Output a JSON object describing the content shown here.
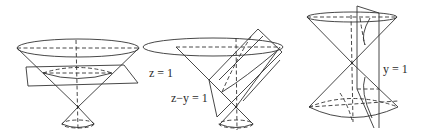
{
  "figures": [
    {
      "id": "cone-horizontal-section",
      "surface": "double cone",
      "plane_label": "z = 1",
      "section_type": "circle"
    },
    {
      "id": "cone-oblique-section",
      "surface": "double cone",
      "plane_label": "z−y = 1",
      "section_type": "parabola"
    },
    {
      "id": "cone-vertical-section",
      "surface": "double cone",
      "plane_label": "y = 1",
      "section_type": "hyperbola"
    }
  ],
  "colors": {
    "line": "#333333",
    "background": "#ffffff"
  }
}
